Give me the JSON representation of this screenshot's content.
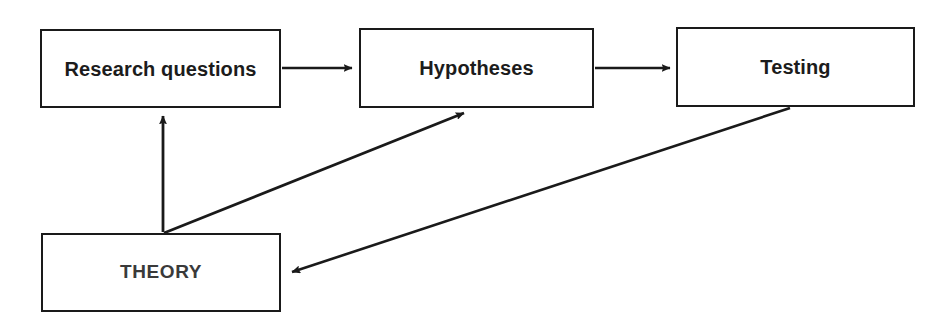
{
  "diagram": {
    "type": "flow-diagram",
    "canvas": {
      "width": 948,
      "height": 331,
      "background": "#ffffff"
    },
    "stroke_color": "#1a1a1a",
    "text_color": "#222222",
    "nodes": [
      {
        "id": "research-questions",
        "label": "Research questions",
        "x": 40,
        "y": 29,
        "width": 241,
        "height": 79,
        "border_color": "#1a1a1a",
        "fill": "#ffffff",
        "text_color": "#1c1c1c",
        "uppercase": false
      },
      {
        "id": "hypotheses",
        "label": "Hypotheses",
        "x": 359,
        "y": 28,
        "width": 235,
        "height": 80,
        "border_color": "#1a1a1a",
        "fill": "#ffffff",
        "text_color": "#1c1c1c",
        "uppercase": false
      },
      {
        "id": "testing",
        "label": "Testing",
        "x": 676,
        "y": 27,
        "width": 239,
        "height": 80,
        "border_color": "#1a1a1a",
        "fill": "#ffffff",
        "text_color": "#1c1c1c",
        "uppercase": false
      },
      {
        "id": "theory",
        "label": "THEORY",
        "x": 41,
        "y": 233,
        "width": 240,
        "height": 79,
        "border_color": "#1a1a1a",
        "fill": "#ffffff",
        "text_color": "#3a3a3a",
        "uppercase": true
      }
    ],
    "edges": [
      {
        "id": "research-questions-to-hypotheses",
        "from": "research-questions",
        "to": "hypotheses",
        "label": "",
        "points": "282,68 352,68",
        "arrowhead": "end"
      },
      {
        "id": "hypotheses-to-testing",
        "from": "hypotheses",
        "to": "testing",
        "label": "",
        "points": "595,68 670,68",
        "arrowhead": "end"
      },
      {
        "id": "theory-to-research-questions",
        "from": "theory",
        "to": "research-questions",
        "label": "",
        "points": "163,232 163,116",
        "arrowhead": "end"
      },
      {
        "id": "theory-to-hypotheses",
        "from": "theory",
        "to": "hypotheses",
        "label": "",
        "points": "164,233 464,113",
        "arrowhead": "end"
      },
      {
        "id": "testing-to-theory",
        "from": "testing",
        "to": "theory",
        "label": "",
        "points": "790,108 292,272",
        "arrowhead": "end"
      }
    ]
  }
}
